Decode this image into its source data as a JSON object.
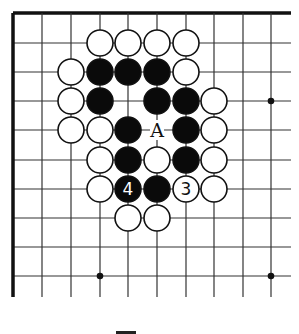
{
  "diagram": {
    "type": "go-board-fragment",
    "corner": "top-left",
    "grid": {
      "origin_x": 13,
      "origin_y": 13,
      "cols_x": [
        13,
        42,
        71,
        100,
        128,
        157,
        186,
        214,
        243,
        271
      ],
      "rows_y": [
        13,
        43,
        72,
        101,
        130,
        160,
        189,
        218,
        247,
        276
      ],
      "line_end_x": 291,
      "line_end_y": 297,
      "line_color": "#333333",
      "edge_color": "#111111"
    },
    "star_points": [
      {
        "col": 9,
        "row": 3
      },
      {
        "col": 3,
        "row": 9
      },
      {
        "col": 9,
        "row": 9
      }
    ],
    "stones": [
      {
        "col": 3,
        "row": 1,
        "color": "white"
      },
      {
        "col": 4,
        "row": 1,
        "color": "white"
      },
      {
        "col": 5,
        "row": 1,
        "color": "white"
      },
      {
        "col": 6,
        "row": 1,
        "color": "white"
      },
      {
        "col": 2,
        "row": 2,
        "color": "white"
      },
      {
        "col": 3,
        "row": 2,
        "color": "black"
      },
      {
        "col": 4,
        "row": 2,
        "color": "black"
      },
      {
        "col": 5,
        "row": 2,
        "color": "black"
      },
      {
        "col": 6,
        "row": 2,
        "color": "white"
      },
      {
        "col": 2,
        "row": 3,
        "color": "white"
      },
      {
        "col": 3,
        "row": 3,
        "color": "black"
      },
      {
        "col": 5,
        "row": 3,
        "color": "black"
      },
      {
        "col": 6,
        "row": 3,
        "color": "black"
      },
      {
        "col": 7,
        "row": 3,
        "color": "white"
      },
      {
        "col": 2,
        "row": 4,
        "color": "white"
      },
      {
        "col": 3,
        "row": 4,
        "color": "white"
      },
      {
        "col": 4,
        "row": 4,
        "color": "black"
      },
      {
        "col": 6,
        "row": 4,
        "color": "black"
      },
      {
        "col": 7,
        "row": 4,
        "color": "white"
      },
      {
        "col": 3,
        "row": 5,
        "color": "white"
      },
      {
        "col": 4,
        "row": 5,
        "color": "black"
      },
      {
        "col": 5,
        "row": 5,
        "color": "white"
      },
      {
        "col": 6,
        "row": 5,
        "color": "black"
      },
      {
        "col": 7,
        "row": 5,
        "color": "white"
      },
      {
        "col": 3,
        "row": 6,
        "color": "white"
      },
      {
        "col": 4,
        "row": 6,
        "color": "black",
        "label": "4"
      },
      {
        "col": 5,
        "row": 6,
        "color": "black"
      },
      {
        "col": 6,
        "row": 6,
        "color": "white",
        "label": "3"
      },
      {
        "col": 7,
        "row": 6,
        "color": "white"
      },
      {
        "col": 4,
        "row": 7,
        "color": "white"
      },
      {
        "col": 5,
        "row": 7,
        "color": "white"
      }
    ],
    "point_labels": [
      {
        "col": 5,
        "row": 4,
        "text": "A"
      }
    ],
    "stone_radius": 13,
    "colors": {
      "black_stone": "#0a0a0a",
      "white_stone": "#ffffff",
      "stone_outline": "#111111",
      "label_on_black": "#ffffff",
      "label_on_white": "#111111"
    }
  }
}
